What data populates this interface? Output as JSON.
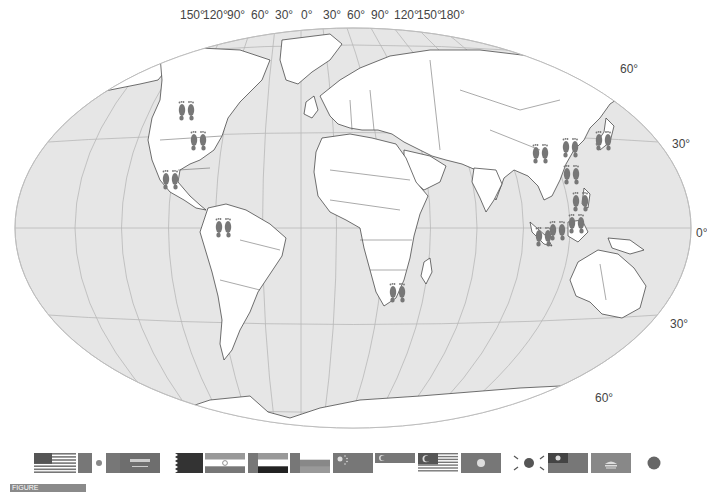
{
  "map": {
    "projection": "Winkel-style world map with graticule",
    "ocean_color": "#e6e6e6",
    "land_color": "#ffffff",
    "graticule_color": "#b8b8b8",
    "marker_color": "#777777",
    "longitude_labels": [
      {
        "text": "150°",
        "x": 180
      },
      {
        "text": "120°",
        "x": 203
      },
      {
        "text": "90°",
        "x": 227
      },
      {
        "text": "60°",
        "x": 251
      },
      {
        "text": "30°",
        "x": 275
      },
      {
        "text": "0°",
        "x": 301
      },
      {
        "text": "30°",
        "x": 323
      },
      {
        "text": "60°",
        "x": 347
      },
      {
        "text": "90°",
        "x": 371
      },
      {
        "text": "120°",
        "x": 394
      },
      {
        "text": "150°",
        "x": 417
      },
      {
        "text": "180°",
        "x": 440
      }
    ],
    "latitude_labels": [
      {
        "text": "60°",
        "x": 620,
        "y": 62
      },
      {
        "text": "30°",
        "x": 672,
        "y": 137
      },
      {
        "text": "0°",
        "x": 696,
        "y": 226
      },
      {
        "text": "30°",
        "x": 670,
        "y": 317
      },
      {
        "text": "60°",
        "x": 595,
        "y": 391
      }
    ],
    "footprint_markers": [
      {
        "region": "Canada",
        "x": 186,
        "y": 107
      },
      {
        "region": "United States",
        "x": 198,
        "y": 137
      },
      {
        "region": "Mexico",
        "x": 170,
        "y": 176
      },
      {
        "region": "Colombia/Venezuela",
        "x": 223,
        "y": 224
      },
      {
        "region": "South Africa",
        "x": 397,
        "y": 289
      },
      {
        "region": "China",
        "x": 540,
        "y": 150
      },
      {
        "region": "Korea",
        "x": 570,
        "y": 144
      },
      {
        "region": "Japan",
        "x": 603,
        "y": 137
      },
      {
        "region": "Taiwan/Hong Kong",
        "x": 571,
        "y": 171
      },
      {
        "region": "Philippines",
        "x": 580,
        "y": 198
      },
      {
        "region": "Malaysia",
        "x": 557,
        "y": 227
      },
      {
        "region": "Singapore",
        "x": 576,
        "y": 220
      },
      {
        "region": "Indonesia",
        "x": 543,
        "y": 233
      }
    ]
  },
  "flags": [
    {
      "name": "United States",
      "x": 34,
      "w": 42
    },
    {
      "name": "Mexico",
      "x": 78,
      "w": 44
    },
    {
      "name": "Saudi Arabia",
      "x": 120,
      "w": 40
    },
    {
      "name": "Qatar",
      "x": 163,
      "w": 40
    },
    {
      "name": "India",
      "x": 205,
      "w": 40
    },
    {
      "name": "United Arab Emirates",
      "x": 248,
      "w": 40
    },
    {
      "name": "Oman",
      "x": 290,
      "w": 40
    },
    {
      "name": "China",
      "x": 333,
      "w": 40
    },
    {
      "name": "Singapore",
      "x": 375,
      "w": 40
    },
    {
      "name": "Malaysia",
      "x": 418,
      "w": 40
    },
    {
      "name": "Hong Kong",
      "x": 461,
      "w": 40
    },
    {
      "name": "South Korea",
      "x": 510,
      "w": 38
    },
    {
      "name": "Taiwan",
      "x": 548,
      "w": 40
    },
    {
      "name": "Macau",
      "x": 591,
      "w": 40
    },
    {
      "name": "Japan",
      "x": 646,
      "w": 16
    }
  ],
  "caption": {
    "badge": "FIGURE",
    "text": ""
  }
}
